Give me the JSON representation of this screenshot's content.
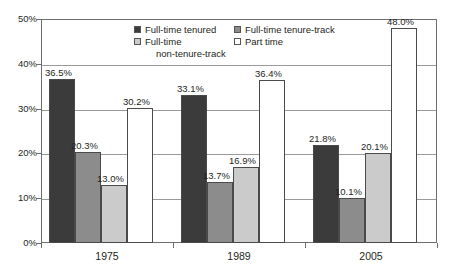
{
  "chart_data": {
    "type": "bar",
    "title": "",
    "subtitle": "",
    "xlabel": "",
    "ylabel": "",
    "categories": [
      "1975",
      "1989",
      "2005"
    ],
    "series": [
      {
        "name": "Full-time tenured",
        "color": "#3b3b3b",
        "values": [
          36.5,
          33.1,
          21.8
        ],
        "labels": [
          "36.5%",
          "33.1%",
          "21.8%"
        ]
      },
      {
        "name": "Full-time tenure-track",
        "color": "#8c8c8c",
        "values": [
          20.3,
          13.7,
          10.1
        ],
        "labels": [
          "20.3%",
          "13.7%",
          "10.1%"
        ]
      },
      {
        "name": "Full-time non-tenure-track",
        "color": "#cbcbcb",
        "values": [
          13.0,
          16.9,
          20.1
        ],
        "labels": [
          "13.0%",
          "16.9%",
          "20.1%"
        ]
      },
      {
        "name": "Part time",
        "color": "#ffffff",
        "values": [
          30.2,
          36.4,
          48.0
        ],
        "labels": [
          "30.2%",
          "36.4%",
          "48.0%"
        ]
      }
    ],
    "ylim": [
      0,
      50
    ],
    "yticks": [
      0,
      10,
      20,
      30,
      40,
      50
    ],
    "ytick_labels": [
      "0%",
      "10%",
      "20%",
      "30%",
      "40%",
      "50%"
    ],
    "grid": true,
    "grid_axis": "y",
    "legend_position": "inside-top-center"
  },
  "legend": {
    "entries": [
      {
        "label": "Full-time tenured",
        "swatch": "#3b3b3b"
      },
      {
        "label": "Full-time tenure-track",
        "swatch": "#8c8c8c"
      },
      {
        "label_line1": "Full-time",
        "label_line2": "non-tenure-track",
        "swatch": "#cbcbcb"
      },
      {
        "label": "Part time",
        "swatch": "#ffffff"
      }
    ]
  },
  "axes": {
    "y_tick_labels": [
      "50%",
      "40%",
      "30%",
      "20%",
      "10%",
      "0%"
    ],
    "x_tick_labels": [
      "1975",
      "1989",
      "2005"
    ]
  },
  "colors": {
    "frame": "#6e6e6e",
    "gridline": "#9a9a9a",
    "bar_outline": "#4a4a4a",
    "text": "#231f20",
    "background": "#ffffff"
  }
}
